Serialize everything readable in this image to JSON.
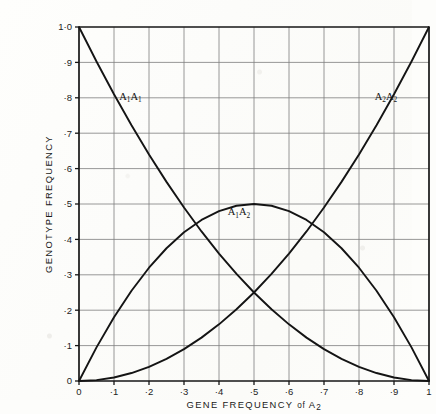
{
  "chart_data": {
    "type": "line",
    "title": "",
    "xlabel": "GENE FREQUENCY of A2",
    "xlabel_main": "GENE FREQUENCY",
    "xlabel_conn": "of",
    "xlabel_var": "A",
    "xlabel_var_sub": "2",
    "ylabel": "GENOTYPE FREQUENCY",
    "xlim": [
      0,
      1
    ],
    "ylim": [
      0,
      1
    ],
    "grid": true,
    "legend": "inline-curve-labels",
    "x": [
      0,
      0.05,
      0.1,
      0.15,
      0.2,
      0.25,
      0.3,
      0.35,
      0.4,
      0.45,
      0.5,
      0.55,
      0.6,
      0.65,
      0.7,
      0.75,
      0.8,
      0.85,
      0.9,
      0.95,
      1
    ],
    "xticks": [
      "0",
      "·1",
      "·2",
      "·3",
      "·4",
      "·5",
      "·6",
      "·7",
      "·8",
      "·9",
      "1"
    ],
    "xtick_values": [
      0,
      0.1,
      0.2,
      0.3,
      0.4,
      0.5,
      0.6,
      0.7,
      0.8,
      0.9,
      1
    ],
    "yticks": [
      "0",
      "·1",
      "·2",
      "·3",
      "·4",
      "·5",
      "·6",
      "·7",
      "·8",
      "·9",
      "1·0"
    ],
    "ytick_values": [
      0,
      0.1,
      0.2,
      0.3,
      0.4,
      0.5,
      0.6,
      0.7,
      0.8,
      0.9,
      1
    ],
    "series": [
      {
        "name": "A1A1",
        "formula": "(1-q)^2",
        "label_base": "A",
        "label_sub1": "1",
        "label_sub2": "1",
        "label_x": 0.115,
        "label_y": 0.795,
        "color": "#141414",
        "values": [
          1,
          0.9025,
          0.81,
          0.7225,
          0.64,
          0.5625,
          0.49,
          0.4225,
          0.36,
          0.3025,
          0.25,
          0.2025,
          0.16,
          0.1225,
          0.09,
          0.0625,
          0.04,
          0.0225,
          0.01,
          0.0025,
          0
        ]
      },
      {
        "name": "A1A2",
        "formula": "2q(1-q)",
        "label_base": "A",
        "label_sub1": "1",
        "label_sub2": "2",
        "label_x": 0.425,
        "label_y": 0.468,
        "color": "#141414",
        "values": [
          0,
          0.095,
          0.18,
          0.255,
          0.32,
          0.375,
          0.42,
          0.455,
          0.48,
          0.495,
          0.5,
          0.495,
          0.48,
          0.455,
          0.42,
          0.375,
          0.32,
          0.255,
          0.18,
          0.095,
          0
        ]
      },
      {
        "name": "A2A2",
        "formula": "q^2",
        "label_base": "A",
        "label_sub1": "2",
        "label_sub2": "2",
        "label_x": 0.845,
        "label_y": 0.795,
        "color": "#141414",
        "values": [
          0,
          0.0025,
          0.01,
          0.0225,
          0.04,
          0.0625,
          0.09,
          0.1225,
          0.16,
          0.2025,
          0.25,
          0.3025,
          0.36,
          0.4225,
          0.49,
          0.5625,
          0.64,
          0.7225,
          0.81,
          0.9025,
          1
        ]
      }
    ]
  },
  "colors": {
    "background": "#fdfdfb",
    "curve": "#141414",
    "grid": "#7d7d7d",
    "axis": "#161616",
    "text": "#1c1c1c"
  }
}
